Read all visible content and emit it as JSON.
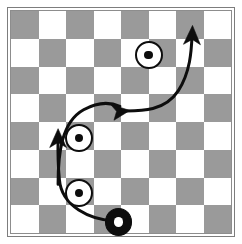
{
  "figure": {
    "title": ""
  },
  "board": {
    "rows": 8,
    "cols": 8,
    "light_color": "#ffffff",
    "dark_color": "#9a9a9a",
    "frame_color": "#7d7d7d",
    "inner_border_color": "#8d8d8d",
    "top_left_square": "dark",
    "pattern": [
      [
        "dark",
        "light",
        "dark",
        "light",
        "dark",
        "light",
        "dark",
        "light"
      ],
      [
        "light",
        "dark",
        "light",
        "dark",
        "light",
        "dark",
        "light",
        "dark"
      ],
      [
        "dark",
        "light",
        "dark",
        "light",
        "dark",
        "light",
        "dark",
        "light"
      ],
      [
        "light",
        "dark",
        "light",
        "dark",
        "light",
        "dark",
        "light",
        "dark"
      ],
      [
        "dark",
        "light",
        "dark",
        "light",
        "dark",
        "light",
        "dark",
        "light"
      ],
      [
        "light",
        "dark",
        "light",
        "dark",
        "light",
        "dark",
        "light",
        "dark"
      ],
      [
        "dark",
        "light",
        "dark",
        "light",
        "dark",
        "light",
        "dark",
        "light"
      ],
      [
        "light",
        "dark",
        "light",
        "dark",
        "light",
        "dark",
        "light",
        "dark"
      ]
    ]
  },
  "pieces": [
    {
      "id": "white-disc-upper-right",
      "kind": "white-disc",
      "col": 5,
      "row": 1,
      "cx_pct": 62.6,
      "cy_pct": 19.8,
      "diameter_pct": 12.6,
      "fill": "#ffffff",
      "stroke": "#0d0d0d",
      "pip": "#0d0d0d"
    },
    {
      "id": "white-disc-middle",
      "kind": "white-disc",
      "col": 2,
      "row": 4,
      "cx_pct": 31.0,
      "cy_pct": 57.2,
      "diameter_pct": 12.6,
      "fill": "#ffffff",
      "stroke": "#0d0d0d",
      "pip": "#0d0d0d"
    },
    {
      "id": "white-disc-lower",
      "kind": "white-disc",
      "col": 2,
      "row": 6,
      "cx_pct": 31.0,
      "cy_pct": 82.0,
      "diameter_pct": 12.6,
      "fill": "#ffffff",
      "stroke": "#0d0d0d",
      "pip": "#0d0d0d"
    },
    {
      "id": "black-disc-start",
      "kind": "black-disc",
      "col": 4,
      "row": 7,
      "cx_pct": 48.8,
      "cy_pct": 95.0,
      "diameter_pct": 12.4,
      "fill": "#0d0d0d",
      "stroke": "#0d0d0d",
      "pip": "#ffffff"
    }
  ],
  "arrows": [
    {
      "id": "arrow-1-start-to-left",
      "from": "black-disc-start",
      "direction": "up",
      "stroke": "#0d0d0d",
      "width": 3.0,
      "path": "M 47.4 94.6 C 36.0 94.2 23.0 88.0 22.0 76.0 C 21.2 68.0 21.3 62.0 21.4 57.5",
      "head": "M 21.4 53.0 L 17.6 61.5 L 21.4 59.2 L 25.2 61.5 Z"
    },
    {
      "id": "arrow-2-left-to-center",
      "from": "white-disc-middle",
      "direction": "right",
      "stroke": "#0d0d0d",
      "width": 3.0,
      "path": "M 21.4 78.0 C 21.4 64.0 23.0 50.0 33.0 44.5 C 40.5 40.4 45.5 41.2 49.5 43.0",
      "head": "M 54.0 44.8 L 45.2 42.0 L 48.0 45.2 L 46.8 49.2 Z"
    },
    {
      "id": "arrow-3-center-to-upper-right",
      "from": "white-disc-upper-right",
      "direction": "up",
      "stroke": "#0d0d0d",
      "width": 3.0,
      "path": "M 50.0 45.0 C 60.0 45.2 70.0 45.0 76.0 36.0 C 81.5 27.5 82.0 18.0 82.3 11.0",
      "head": "M 82.5 6.5 L 78.4 15.0 L 82.4 12.8 L 86.1 15.2 Z"
    }
  ]
}
